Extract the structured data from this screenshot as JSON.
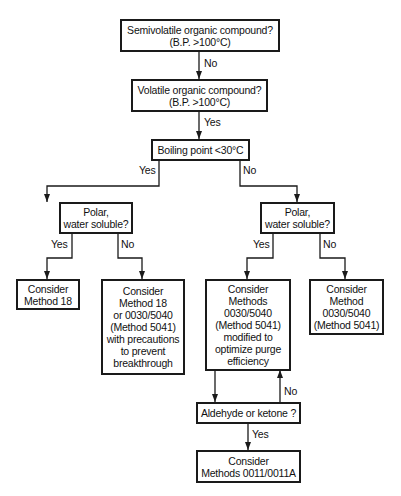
{
  "flowchart": {
    "nodes": {
      "semivolatile": "Semivolatile organic compound?\n(B.P. >100°C)",
      "volatile": "Volatile organic compound?\n(B.P. >100°C)",
      "boiling_point": "Boiling point <30°C",
      "polar_left": "Polar,\nwater soluble?",
      "polar_right": "Polar,\nwater soluble?",
      "method18": "Consider\nMethod 18",
      "method18_or": "Consider\nMethod 18\nor 0030/5040\n(Method 5041)\nwith precautions\nto prevent\nbreakthrough",
      "methods_modified": "Consider\nMethods\n0030/5040\n(Method 5041)\nmodified to\noptimize purge\nefficiency",
      "method_0030": "Consider\nMethod\n0030/5040\n(Method 5041)",
      "aldehyde": "Aldehyde or ketone ?",
      "methods_0011": "Consider\nMethods 0011/0011A"
    },
    "edge_labels": {
      "semivolatile_to_volatile": "No",
      "volatile_to_boiling": "Yes",
      "boiling_yes": "Yes",
      "boiling_no": "No",
      "polar_left_yes": "Yes",
      "polar_left_no": "No",
      "polar_right_yes": "Yes",
      "polar_right_no": "No",
      "aldehyde_no": "No",
      "aldehyde_yes": "Yes"
    }
  }
}
